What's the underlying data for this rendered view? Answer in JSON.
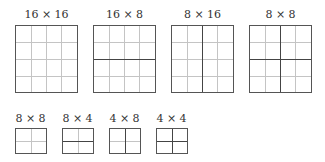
{
  "large_blocks": [
    {
      "label": "16 × 16",
      "grid": 4,
      "split": "none"
    },
    {
      "label": "16 × 8",
      "grid": 4,
      "split": "horizontal"
    },
    {
      "label": "8 × 16",
      "grid": 4,
      "split": "vertical"
    },
    {
      "label": "8 × 8",
      "grid": 4,
      "split": "both"
    }
  ],
  "small_blocks": [
    {
      "label": "8 × 8",
      "grid": 2,
      "split": "none"
    },
    {
      "label": "8 × 4",
      "grid": 2,
      "split": "horizontal"
    },
    {
      "label": "4 × 8",
      "grid": 2,
      "split": "vertical"
    },
    {
      "label": "4 × 4",
      "grid": 2,
      "split": "both"
    }
  ],
  "colors": {
    "grid_line": "#c4c4c4",
    "split_line": "#444444",
    "border": "#555555"
  }
}
